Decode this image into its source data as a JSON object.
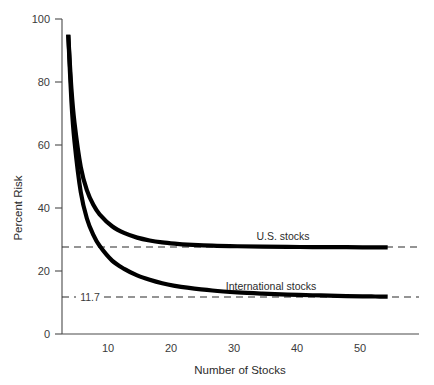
{
  "chart_data": {
    "type": "line",
    "title": "",
    "xlabel": "Number of Stocks",
    "ylabel": "Percent Risk",
    "xlim": [
      0,
      57
    ],
    "ylim": [
      0,
      100
    ],
    "grid": false,
    "legend_position": "inline-above-curve",
    "xticks": [
      10,
      20,
      30,
      40,
      50
    ],
    "xtick_labels": [
      "10",
      "20",
      "30",
      "40",
      "50"
    ],
    "yticks": [
      0,
      20,
      40,
      60,
      80,
      100
    ],
    "ytick_labels": [
      "0",
      "20",
      "40",
      "60",
      "80",
      "100"
    ],
    "series": [
      {
        "name": "U.S. stocks",
        "asymptote": 27.5,
        "asymptote_label": "",
        "x": [
          1,
          1.5,
          2,
          3,
          4,
          5,
          6,
          8,
          10,
          12,
          14,
          16,
          18,
          20,
          24,
          28,
          32,
          36,
          40,
          44,
          48,
          50,
          52
        ],
        "values": [
          95,
          78,
          67,
          53,
          45.5,
          41,
          38,
          34.2,
          32,
          30.6,
          29.7,
          29.1,
          28.7,
          28.4,
          28.05,
          27.85,
          27.72,
          27.64,
          27.6,
          27.56,
          27.53,
          27.52,
          27.5
        ]
      },
      {
        "name": "International stocks",
        "asymptote": 11.7,
        "asymptote_label": "11.7",
        "x": [
          1,
          1.5,
          2,
          3,
          4,
          5,
          6,
          8,
          10,
          12,
          14,
          16,
          18,
          20,
          24,
          28,
          32,
          36,
          40,
          44,
          48,
          50,
          52
        ],
        "values": [
          95,
          74,
          61,
          45,
          36.5,
          31.5,
          28,
          23.3,
          20.6,
          18.6,
          17.2,
          16.1,
          15.3,
          14.7,
          13.8,
          13.2,
          12.8,
          12.5,
          12.3,
          12.1,
          11.95,
          11.9,
          11.85
        ]
      }
    ]
  },
  "labels": {
    "us_stocks": "U.S. stocks",
    "international_stocks": "International stocks",
    "annotation_117": "11.7",
    "x_axis_title": "Number of Stocks",
    "y_axis_title": "Percent Risk",
    "ytick_0": "0",
    "ytick_20": "20",
    "ytick_40": "40",
    "ytick_60": "60",
    "ytick_80": "80",
    "ytick_100": "100",
    "xtick_10": "10",
    "xtick_20": "20",
    "xtick_30": "30",
    "xtick_40": "40",
    "xtick_50": "50"
  },
  "colors": {
    "curve": "#000000",
    "axis": "#4a4a4a",
    "text": "#2b2b2b",
    "background": "#ffffff"
  }
}
